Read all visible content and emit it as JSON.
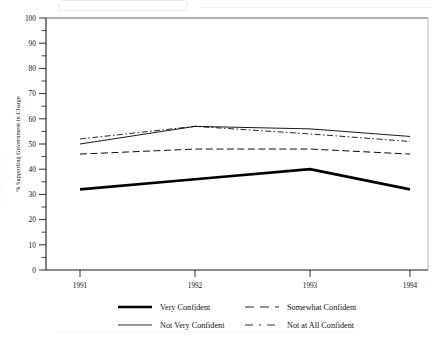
{
  "chart_data": {
    "type": "line",
    "title": "",
    "xlabel": "",
    "ylabel": "% Supporting Government in Charge",
    "categories": [
      "1991",
      "1992",
      "1993",
      "1994"
    ],
    "x": [
      1991,
      1992,
      1993,
      1994
    ],
    "ylim": [
      0,
      100
    ],
    "ytick_labels": [
      "0",
      "10",
      "20",
      "30",
      "40",
      "50",
      "60",
      "70",
      "80",
      "90",
      "100"
    ],
    "ytick_values": [
      0,
      10,
      20,
      30,
      40,
      50,
      60,
      70,
      80,
      90,
      100
    ],
    "yminor_step": 5,
    "grid": false,
    "legend_position": "below-plot",
    "legend_columns": 2,
    "series": [
      {
        "name": "Very Confident",
        "values": [
          32,
          36,
          40,
          32
        ],
        "style": "solid-thick",
        "color": "#000000"
      },
      {
        "name": "Somewhat Confident",
        "values": [
          46,
          48,
          48,
          46
        ],
        "style": "dashed",
        "color": "#000000"
      },
      {
        "name": "Not Very Confident",
        "values": [
          50,
          57,
          56,
          53
        ],
        "style": "solid-thin",
        "color": "#000000"
      },
      {
        "name": "Not at All Confident",
        "values": [
          52,
          57,
          54,
          51
        ],
        "style": "dash-dot",
        "color": "#000000"
      }
    ]
  },
  "axes": {
    "y_title": "% Supporting Government in Charge",
    "y_labels": [
      "100",
      "90",
      "80",
      "70",
      "60",
      "50",
      "40",
      "30",
      "20",
      "10",
      "0"
    ],
    "x_labels": [
      "1991",
      "1992",
      "1993",
      "1994"
    ]
  },
  "legend": {
    "entries": [
      {
        "label": "Very Confident",
        "style": "solid-thick"
      },
      {
        "label": "Somewhat Confident",
        "style": "dashed"
      },
      {
        "label": "Not Very Confident",
        "style": "solid-thin"
      },
      {
        "label": "Not at All Confident",
        "style": "dash-dot"
      }
    ]
  },
  "colors": {
    "ink": "#111111",
    "axis": "#222222",
    "paper": "#ffffff",
    "scan_artifact": "#d8d6d2"
  }
}
